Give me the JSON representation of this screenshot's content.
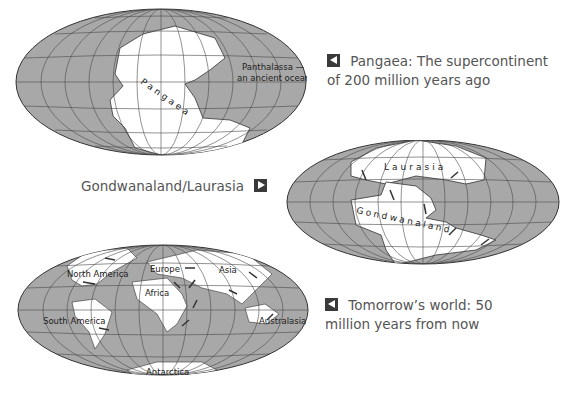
{
  "maps": [
    {
      "id": "pangaea",
      "caption_line1": "Pangaea: The supercontinent",
      "caption_line2": "of 200 million years ago",
      "caption_arrow": "left",
      "labels": {
        "supercontinent": "Pangaea",
        "ocean_line1": "Panthalassa —",
        "ocean_line2": "an ancient ocean"
      }
    },
    {
      "id": "gondwanaland-laurasia",
      "caption_line1": "Gondwanaland/Laurasia",
      "caption_arrow": "right",
      "labels": {
        "north": "Laurasia",
        "south": "Gondwanaland"
      }
    },
    {
      "id": "tomorrow",
      "caption_line1": "Tomorrow’s world: 50",
      "caption_line2": "million years from now",
      "caption_arrow": "left",
      "labels": {
        "north_america": "North America",
        "europe": "Europe",
        "asia": "Asia",
        "africa": "Africa",
        "south_america": "South America",
        "australasia": "Australasia",
        "antarctica": "Antarctica"
      }
    }
  ],
  "colors": {
    "ocean": "#a8a8a8",
    "land": "#ffffff",
    "grid": "#4a4a4a",
    "caption_text": "#555555",
    "arrow_box": "#3a3a3a"
  }
}
